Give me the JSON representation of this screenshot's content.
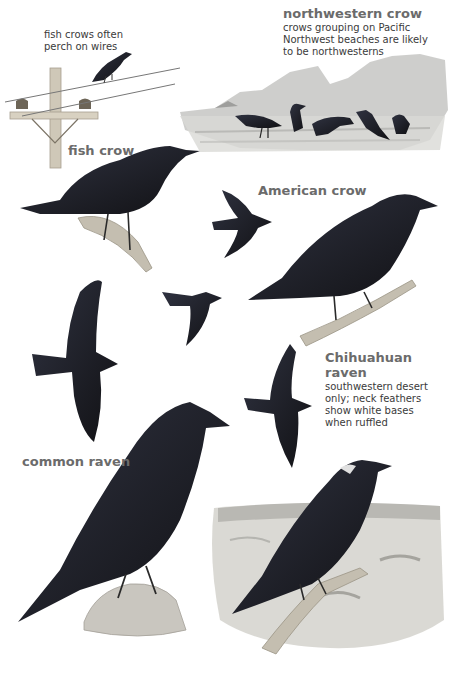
{
  "plate": {
    "species": [
      {
        "id": "northwestern-crow",
        "name": "northwestern crow",
        "note_lines": [
          "crows grouping on Pacific",
          "Northwest beaches are likely",
          "to be northwesterns"
        ]
      },
      {
        "id": "fish-crow",
        "name": "fish crow",
        "note_lines": [
          "fish crows often",
          "perch on wires"
        ]
      },
      {
        "id": "american-crow",
        "name": "American crow",
        "note_lines": []
      },
      {
        "id": "chihuahuan-raven",
        "name_lines": [
          "Chihuahuan",
          "raven"
        ],
        "note_lines": [
          "southwestern desert",
          "only; neck feathers",
          "show white bases",
          "when ruffled"
        ]
      },
      {
        "id": "common-raven",
        "name": "common raven",
        "note_lines": []
      }
    ]
  },
  "colors": {
    "label_gray": "#6b6b6b",
    "note_text": "#3a3a3a",
    "bird_black": "#151518",
    "bird_gloss": "#2b2d36",
    "landscape_gray": "#b9b9b6",
    "pole_wood": "#cfc8b8"
  }
}
